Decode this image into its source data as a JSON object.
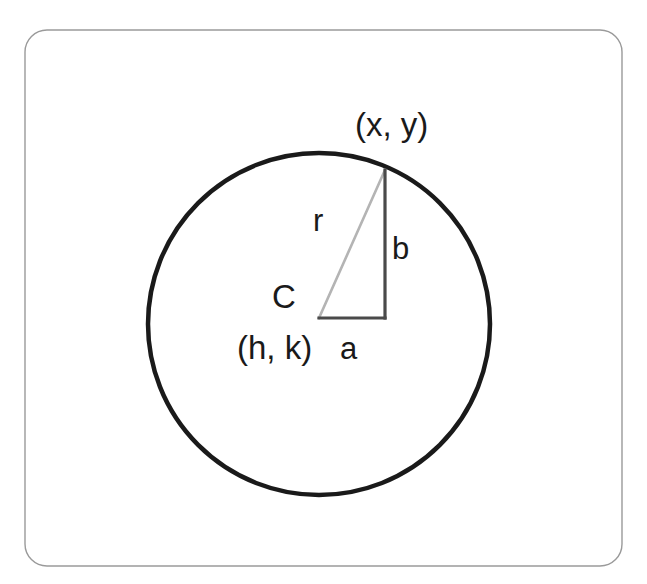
{
  "figure": {
    "background_color": "#ffffff",
    "frame": {
      "name": "rounded-frame",
      "stroke_color": "#9a9a9a",
      "stroke_width": 1.4,
      "corner_radius": 22,
      "x": 25,
      "y": 30,
      "width": 597,
      "height": 536
    },
    "circle": {
      "name": "main-circle",
      "center_x": 319,
      "center_y": 324,
      "radius": 171,
      "stroke_color": "#1a1a1a",
      "stroke_width": 4.5,
      "fill": "none"
    },
    "triangle": {
      "name": "right-triangle",
      "center_vertex": {
        "x": 319,
        "y": 318
      },
      "circle_vertex": {
        "x": 385,
        "y": 170
      },
      "corner_vertex": {
        "x": 385,
        "y": 318
      },
      "leg_a_stroke_color": "#4a4a4a",
      "leg_b_stroke_color": "#4a4a4a",
      "leg_stroke_width": 3.2,
      "hypotenuse_stroke_color": "#b4b4b4",
      "hypotenuse_stroke_width": 2.6
    },
    "labels": {
      "point_on_circle": {
        "text": "(x, y)",
        "x": 355,
        "y": 136
      },
      "radius": {
        "text": "r",
        "x": 313,
        "y": 231
      },
      "leg_vertical": {
        "text": "b",
        "x": 392,
        "y": 259
      },
      "center_marker": {
        "text": "C",
        "x": 272,
        "y": 308
      },
      "center_coords": {
        "text": "(h, k)",
        "x": 237,
        "y": 359
      },
      "leg_horizontal": {
        "text": "a",
        "x": 340,
        "y": 359
      }
    }
  }
}
